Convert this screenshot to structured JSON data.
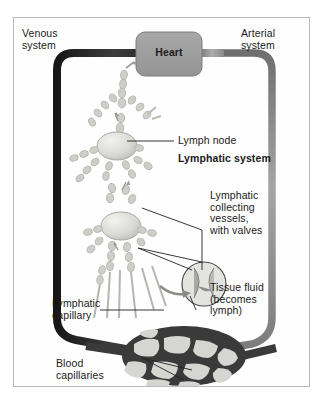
{
  "figure": {
    "type": "anatomical-schematic",
    "frame_color": "#b9b9b9",
    "background_color": "#fefefe"
  },
  "labels": {
    "venous_system": "Venous\nsystem",
    "arterial_system": "Arterial\nsystem",
    "heart": "Heart",
    "lymph_node": "Lymph node",
    "lymphatic_system": "Lymphatic system",
    "collecting_vessels": "Lymphatic\ncollecting\nvessels,\nwith valves",
    "tissue_fluid": "Tissue fluid\n(becomes\nlymph)",
    "lymphatic_capillary": "Lymphatic\ncapillary",
    "blood_capillaries": "Blood\ncapillaries"
  },
  "colors": {
    "venous_vessel": "#2b2b2b",
    "arterial_vessel": "#8e8e8e",
    "heart_box": "#9d9d9d",
    "heart_box_border": "#7d7d7d",
    "lymph_vessel": "#c9c9c5",
    "lymph_node": "#d8d8d4",
    "capillary_mesh": "#3a3a3a",
    "capillary_lumen": "#d5d5d2",
    "leader_line": "#222222",
    "text": "#1a1a1a"
  },
  "elements": {
    "heart_box": {
      "shape": "rounded-rectangle"
    },
    "valve_inset": {
      "shape": "circle",
      "depicts": "valve leaflets"
    },
    "capillary_bed": {
      "shape": "oval-mesh"
    },
    "lymph_nodes_count": 2
  }
}
